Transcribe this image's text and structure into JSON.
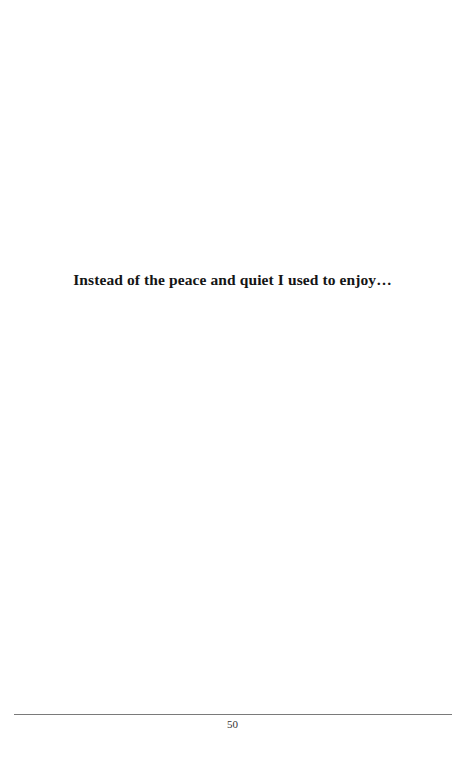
{
  "page": {
    "heading": "Instead of the peace and quiet I used to enjoy…",
    "footer": {
      "page_number": "50"
    }
  }
}
